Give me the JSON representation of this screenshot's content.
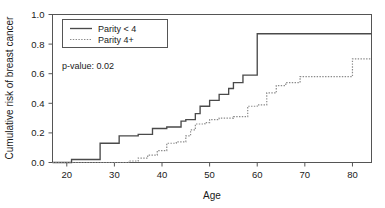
{
  "chart_data": {
    "type": "line",
    "title": "",
    "xlabel": "Age",
    "ylabel": "Cumulative risk of breast cancer",
    "xlim": [
      17,
      84
    ],
    "ylim": [
      0.0,
      1.0
    ],
    "grid": false,
    "xticks": [
      20,
      30,
      40,
      50,
      60,
      70,
      80
    ],
    "xtick_labels": [
      "20",
      "30",
      "40",
      "50",
      "60",
      "70",
      "80"
    ],
    "yticks": [
      0.0,
      0.2,
      0.4,
      0.6,
      0.8,
      1.0
    ],
    "ytick_labels": [
      "0.0",
      "0.2",
      "0.4",
      "0.6",
      "0.8",
      "1.0"
    ],
    "legend_position": "top-left",
    "annotations": [
      {
        "text": "p-value: 0.02",
        "x": 22,
        "y": 0.68
      }
    ],
    "series": [
      {
        "name": "Parity < 4",
        "style": "solid",
        "color": "#4a4a4a",
        "step": "post",
        "x": [
          17,
          21,
          27,
          31,
          35,
          38,
          41,
          44,
          45,
          47,
          48,
          50,
          52,
          54,
          55,
          57,
          60,
          80,
          84
        ],
        "y": [
          0.0,
          0.02,
          0.13,
          0.18,
          0.19,
          0.23,
          0.24,
          0.28,
          0.29,
          0.33,
          0.38,
          0.42,
          0.46,
          0.5,
          0.54,
          0.59,
          0.87,
          0.87,
          0.87
        ]
      },
      {
        "name": "Parity 4+",
        "style": "dotted",
        "color": "#8a8a8a",
        "step": "post",
        "x": [
          17,
          33,
          35,
          37,
          39,
          41,
          43,
          45,
          46,
          47,
          49,
          50,
          52,
          55,
          58,
          60,
          62,
          64,
          66,
          69,
          80,
          84
        ],
        "y": [
          0.0,
          0.01,
          0.03,
          0.05,
          0.08,
          0.13,
          0.14,
          0.18,
          0.22,
          0.26,
          0.27,
          0.29,
          0.3,
          0.31,
          0.38,
          0.39,
          0.47,
          0.52,
          0.54,
          0.58,
          0.7,
          0.7
        ]
      }
    ]
  },
  "legend": {
    "entries": [
      {
        "label": "Parity < 4"
      },
      {
        "label": "Parity 4+"
      }
    ]
  },
  "axes": {
    "x_title": "Age",
    "y_title": "Cumulative risk of breast cancer"
  },
  "annotation": {
    "pvalue_label": "p-value: 0.02"
  }
}
